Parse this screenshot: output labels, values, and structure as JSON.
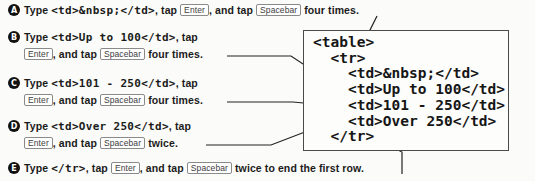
{
  "page": {
    "bg": "#fbfbf9",
    "ink": "#1b1b1b",
    "badge_fill": "#111111",
    "keycap_border": "#8a8a8a",
    "code_box_border": "#4a4a4a"
  },
  "steps": [
    {
      "label": "A",
      "lines": [
        [
          {
            "t": "text",
            "v": "Type "
          },
          {
            "t": "code",
            "v": "<td>&nbsp;</td>"
          },
          {
            "t": "text",
            "v": ", tap "
          },
          {
            "t": "key",
            "v": "Enter"
          },
          {
            "t": "text",
            "v": ", and tap "
          },
          {
            "t": "key",
            "v": "Spacebar"
          },
          {
            "t": "text",
            "v": " four times."
          }
        ]
      ]
    },
    {
      "label": "B",
      "lines": [
        [
          {
            "t": "text",
            "v": "Type "
          },
          {
            "t": "code",
            "v": "<td>Up to 100</td>"
          },
          {
            "t": "text",
            "v": ", tap"
          }
        ],
        [
          {
            "t": "key",
            "v": "Enter"
          },
          {
            "t": "text",
            "v": ", and tap "
          },
          {
            "t": "key",
            "v": "Spacebar"
          },
          {
            "t": "text",
            "v": " four times."
          }
        ]
      ]
    },
    {
      "label": "C",
      "lines": [
        [
          {
            "t": "text",
            "v": "Type "
          },
          {
            "t": "code",
            "v": "<td>101 - 250</td>"
          },
          {
            "t": "text",
            "v": ", tap"
          }
        ],
        [
          {
            "t": "key",
            "v": "Enter"
          },
          {
            "t": "text",
            "v": ", and tap "
          },
          {
            "t": "key",
            "v": "Spacebar"
          },
          {
            "t": "text",
            "v": " four times."
          }
        ]
      ]
    },
    {
      "label": "D",
      "lines": [
        [
          {
            "t": "text",
            "v": "Type "
          },
          {
            "t": "code",
            "v": "<td>Over 250</td>"
          },
          {
            "t": "text",
            "v": ", tap"
          }
        ],
        [
          {
            "t": "key",
            "v": "Enter"
          },
          {
            "t": "text",
            "v": ", and tap "
          },
          {
            "t": "key",
            "v": "Spacebar"
          },
          {
            "t": "text",
            "v": " twice."
          }
        ]
      ]
    },
    {
      "label": "E",
      "lines": [
        [
          {
            "t": "text",
            "v": "Type "
          },
          {
            "t": "code",
            "v": "</tr>"
          },
          {
            "t": "text",
            "v": ", tap "
          },
          {
            "t": "key",
            "v": "Enter"
          },
          {
            "t": "text",
            "v": ", and tap "
          },
          {
            "t": "key",
            "v": "Spacebar"
          },
          {
            "t": "text",
            "v": " twice to end the first row."
          }
        ]
      ]
    }
  ],
  "code_box": {
    "lines": [
      "<table>",
      "  <tr>",
      "    <td>&nbsp;</td>",
      "    <td>Up to 100</td>",
      "    <td>101 - 250</td>",
      "    <td>Over 250</td>",
      "  </tr>"
    ]
  }
}
